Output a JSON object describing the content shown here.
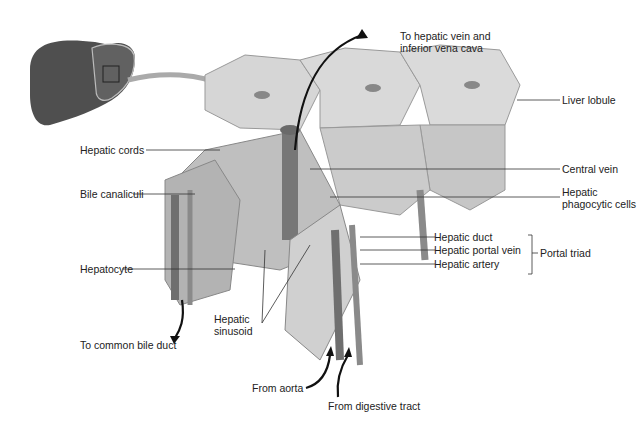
{
  "diagram": {
    "labels": {
      "to_hepatic_vein": "To hepatic vein and inferior vena cava",
      "to_hepatic_vein_line1": "To hepatic vein and",
      "to_hepatic_vein_line2": "inferior vena cava",
      "liver_lobule": "Liver lobule",
      "hepatic_cords": "Hepatic cords",
      "central_vein": "Central vein",
      "bile_canaliculi": "Bile canaliculi",
      "hepatic_phagocytic_line1": "Hepatic",
      "hepatic_phagocytic_line2": "phagocytic cells",
      "hepatic_duct": "Hepatic duct",
      "hepatic_portal_vein": "Hepatic portal vein",
      "hepatic_artery": "Hepatic artery",
      "portal_triad": "Portal triad",
      "hepatocyte": "Hepatocyte",
      "hepatic_sinusoid_line1": "Hepatic",
      "hepatic_sinusoid_line2": "sinusoid",
      "to_common_bile_duct": "To common bile duct",
      "from_aorta": "From aorta",
      "from_digestive_tract": "From digestive tract"
    },
    "colors": {
      "liver": "#5a5a5a",
      "lobule_face": "#d8d8d8",
      "lobule_side": "#bdbdbd",
      "vessel": "#7a7a7a",
      "leader": "#333333",
      "arrow": "#111111"
    }
  }
}
